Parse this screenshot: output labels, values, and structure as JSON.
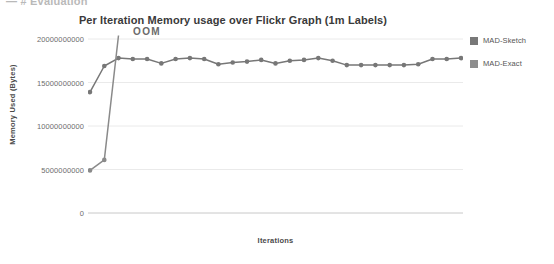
{
  "page_header": {
    "text": "—  # Evaluation"
  },
  "chart_data": {
    "type": "line",
    "title": "Per Iteration Memory usage over Flickr Graph (1m Labels)",
    "xlabel": "Iterations",
    "ylabel": "Memory Used (Bytes)",
    "grid": true,
    "legend_position": "right",
    "ylim": [
      0,
      20000000000
    ],
    "ytick_labels": [
      "20000000000",
      "15000000000",
      "10000000000",
      "5000000000",
      "0"
    ],
    "ytick_values": [
      20000000000,
      15000000000,
      10000000000,
      5000000000,
      0
    ],
    "xtick_labels": [],
    "annotations": [
      {
        "text": "OOM",
        "x": 4,
        "y": 20000000000
      }
    ],
    "colors": {
      "MAD-Sketch": "#777777",
      "MAD-Exact": "#8a8a8a",
      "gridline": "#eaeaea",
      "axis": "#c8c8c8",
      "background": "#ffffff"
    },
    "series": [
      {
        "name": "MAD-Sketch",
        "color": "#777777",
        "x": [
          1,
          2,
          3,
          4,
          5,
          6,
          7,
          8,
          9,
          10,
          11,
          12,
          13,
          14,
          15,
          16,
          17,
          18,
          19,
          20,
          21,
          22,
          23,
          24,
          25,
          26,
          27
        ],
        "values": [
          13900000000,
          16900000000,
          17800000000,
          17700000000,
          17700000000,
          17200000000,
          17700000000,
          17800000000,
          17700000000,
          17100000000,
          17300000000,
          17400000000,
          17600000000,
          17200000000,
          17500000000,
          17600000000,
          17800000000,
          17500000000,
          17000000000,
          17000000000,
          17000000000,
          17000000000,
          17000000000,
          17100000000,
          17700000000,
          17700000000,
          17800000000
        ]
      },
      {
        "name": "MAD-Exact",
        "color": "#8a8a8a",
        "x": [
          1,
          2,
          3
        ],
        "values": [
          4900000000,
          6100000000,
          20400000000
        ]
      }
    ]
  },
  "legend": {
    "items": [
      {
        "label": "MAD-Sketch",
        "color": "#787878"
      },
      {
        "label": "MAD-Exact",
        "color": "#8d8d8d"
      }
    ]
  }
}
